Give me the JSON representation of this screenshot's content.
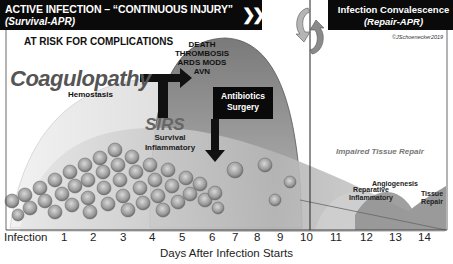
{
  "header": {
    "left_title": "ACTIVE INFECTION – “CONTINUOUS INJURY”",
    "left_subtitle": "(Survival-APR)",
    "chevrons": "❯❯❯",
    "right_title": "Infection Convalescence",
    "right_subtitle": "(Repair-APR)",
    "copyright": "©JSchoenecker2019"
  },
  "labels": {
    "at_risk": "AT RISK FOR COMPLICATIONS",
    "complications": [
      "DEATH",
      "THROMBOSIS",
      "ARDS   MODS",
      "AVN"
    ],
    "coagulopathy": "Coagulopathy",
    "hemostasis": "Hemostasis",
    "sirs": "SIRS",
    "sirs_sub": [
      "Survival",
      "Inflammatory"
    ],
    "antibiotics_box": [
      "Antibiotics",
      "Surgery"
    ],
    "impaired_repair": "Impaired Tissue Repair",
    "reparative": [
      "Reparative",
      "Inflammatory"
    ],
    "angiogenesis": "Angiogenesis",
    "tissue_repair": [
      "Tissue",
      "Repair"
    ]
  },
  "axis": {
    "ticks": [
      {
        "label": "Infection",
        "x": 4
      },
      {
        "label": "1",
        "x": 61
      },
      {
        "label": "2",
        "x": 90
      },
      {
        "label": "3",
        "x": 120
      },
      {
        "label": "4",
        "x": 149
      },
      {
        "label": "5",
        "x": 179
      },
      {
        "label": "6",
        "x": 209
      },
      {
        "label": "7",
        "x": 232
      },
      {
        "label": "8",
        "x": 254
      },
      {
        "label": "9",
        "x": 277
      },
      {
        "label": "10",
        "x": 300
      },
      {
        "label": "11",
        "x": 330
      },
      {
        "label": "12",
        "x": 360
      },
      {
        "label": "13",
        "x": 389
      },
      {
        "label": "14",
        "x": 418
      }
    ],
    "xlabel": "Days After Infection Starts"
  },
  "colors": {
    "header_bg": "#0a0a0a",
    "curve_dark": "#6e6e6e",
    "curve_mid": "#a8a8a8",
    "curve_light": "#d8d8d8",
    "text_gray": "#555555"
  }
}
